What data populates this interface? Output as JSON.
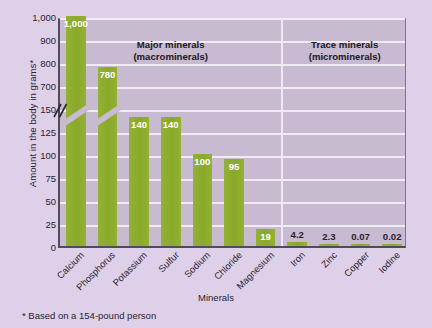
{
  "chart_data": {
    "type": "bar",
    "title": "",
    "xlabel": "Minerals",
    "ylabel": "Amount in the body in grams*",
    "footnote": "* Based on a 154-pound person",
    "categories": [
      "Calcium",
      "Phosphorus",
      "Potassium",
      "Sulfur",
      "Sodium",
      "Chloride",
      "Magnesium",
      "Iron",
      "Zinc",
      "Copper",
      "Iodine"
    ],
    "values": [
      1000,
      780,
      140,
      140,
      100,
      95,
      19,
      4.2,
      2.3,
      0.07,
      0.02
    ],
    "value_labels": [
      "1,000",
      "780",
      "140",
      "140",
      "100",
      "95",
      "19",
      "4.2",
      "2.3",
      "0.07",
      "0.02"
    ],
    "label_placement": [
      "inside",
      "inside",
      "inside",
      "inside",
      "inside",
      "inside",
      "inside",
      "outside",
      "outside",
      "outside",
      "outside"
    ],
    "ytick_labels": [
      "0",
      "25",
      "50",
      "75",
      "100",
      "125",
      "150",
      "700",
      "800",
      "900",
      "1,000"
    ],
    "ytick_values": [
      0,
      25,
      50,
      75,
      100,
      125,
      150,
      700,
      800,
      900,
      1000
    ],
    "axis_break": true,
    "axis_break_between": [
      150,
      700
    ],
    "ylim": [
      0,
      1000
    ],
    "grid": "horizontal",
    "legend": "none",
    "bar_color": "#8dac2c",
    "plot_background": "#c8bad0",
    "page_background": "#ddd0e8",
    "gridline_color": "#f4eff7",
    "axis_color": "#514a5c",
    "groups": [
      {
        "label_line1": "Major minerals",
        "label_line2": "(macrominerals)",
        "members": [
          "Calcium",
          "Phosphorus",
          "Potassium",
          "Sulfur",
          "Sodium",
          "Chloride",
          "Magnesium"
        ]
      },
      {
        "label_line1": "Trace minerals",
        "label_line2": "(microminerals)",
        "members": [
          "Iron",
          "Zinc",
          "Copper",
          "Iodine"
        ]
      }
    ]
  }
}
